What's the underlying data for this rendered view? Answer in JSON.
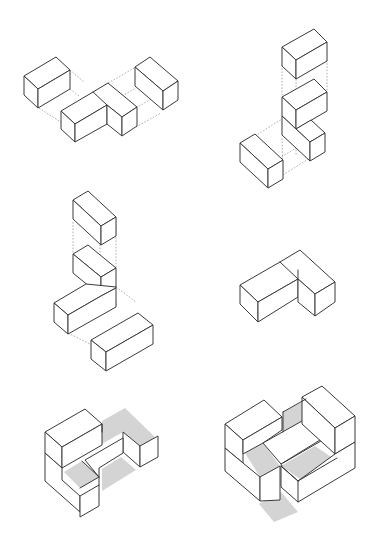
{
  "diagram": {
    "title": "",
    "colors": {
      "background": "#ffffff",
      "edge": "#3a3a3a",
      "projection": "#9a9a9a",
      "shade": "#d4d4d4"
    },
    "iso": {
      "u": [
        16,
        -9.3
      ],
      "v": [
        15,
        8.6
      ],
      "h": 19
    },
    "figures": [
      {
        "id": "fig-1",
        "label": "exploded-horizontal-set",
        "origin": [
          24,
          95
        ],
        "blocks": [
          {
            "x": 0,
            "y": 0,
            "z": 0,
            "l": 2,
            "w": 1,
            "hgt": 1
          },
          {
            "x": -0.4,
            "y": 2.4,
            "z": 0,
            "l": 2,
            "w": 1,
            "hgt": 1
          },
          {
            "x": 1.6,
            "y": 2.4,
            "z": 0,
            "l": 1,
            "w": 2,
            "hgt": 1,
            "mergeWith": "prev"
          },
          {
            "x": 4.8,
            "y": 1.1,
            "z": 0,
            "l": 1,
            "w": 2,
            "hgt": 1
          }
        ]
      },
      {
        "id": "fig-2",
        "label": "exploded-vertical-stack-right",
        "origin": [
          240,
          148
        ]
      },
      {
        "id": "fig-3",
        "label": "exploded-vertical-stack-left",
        "origin": [
          55,
          305
        ]
      },
      {
        "id": "fig-4",
        "label": "assembled-l-shape",
        "origin": [
          240,
          295
        ]
      },
      {
        "id": "fig-5",
        "label": "assembled-two-level-with-shadow",
        "origin": [
          45,
          460
        ]
      },
      {
        "id": "fig-6",
        "label": "assembled-courtyard-with-shadow",
        "origin": [
          225,
          435
        ]
      }
    ]
  }
}
